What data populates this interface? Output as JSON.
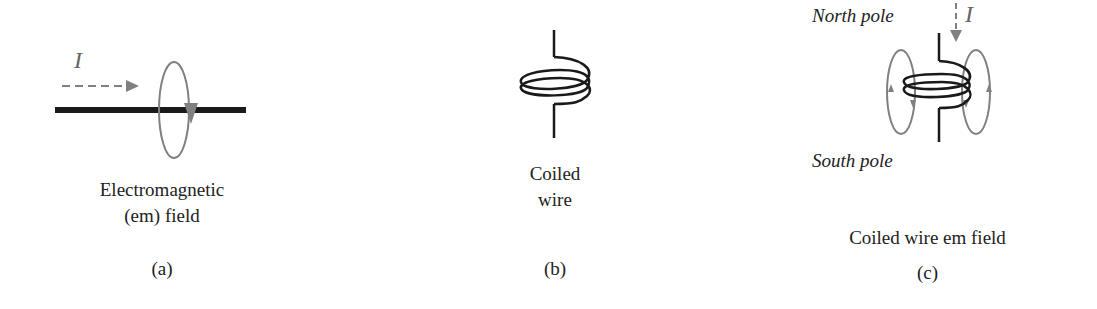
{
  "panels": [
    {
      "id": "a",
      "caption_line1": "Electromagnetic",
      "caption_line2": "(em) field",
      "tag": "(a)",
      "current_symbol": "I"
    },
    {
      "id": "b",
      "caption_line1": "Coiled",
      "caption_line2": "wire",
      "tag": "(b)"
    },
    {
      "id": "c",
      "north_label": "North pole",
      "south_label": "South pole",
      "caption": "Coiled wire em field",
      "tag": "(c)",
      "current_symbol": "I"
    }
  ],
  "colors": {
    "wire": "#1a1a1a",
    "field": "#808080",
    "text": "#222222"
  }
}
